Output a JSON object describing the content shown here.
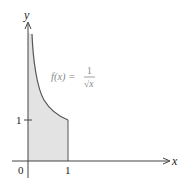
{
  "figure": {
    "function_label": "f(x) =",
    "fraction_numerator": "1",
    "fraction_denominator": "√x",
    "x_axis_label": "x",
    "y_axis_label": "y",
    "origin_label": "0",
    "x_tick_label": "1",
    "y_tick_label": "1",
    "colors": {
      "shade": "#e3e3e3",
      "curve": "#555555",
      "axis": "#444444",
      "label_faded": "#888888"
    }
  }
}
